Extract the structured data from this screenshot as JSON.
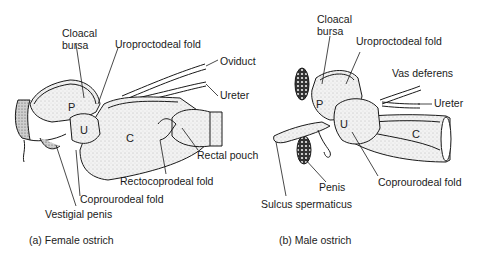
{
  "figure": {
    "panels": [
      {
        "id": "a",
        "caption": "(a) Female ostrich",
        "labels": {
          "cloacal_bursa_1": "Cloacal",
          "cloacal_bursa_2": "bursa",
          "uroproctodeal_fold": "Uroproctodeal fold",
          "oviduct": "Oviduct",
          "ureter": "Ureter",
          "rectal_pouch": "Rectal pouch",
          "rectocoprodeal_fold": "Rectocoprodeal fold",
          "coprourodeal_fold": "Coprourodeal fold",
          "vestigial_penis": "Vestigial penis"
        },
        "chambers": {
          "p": "P",
          "u": "U",
          "c": "C"
        }
      },
      {
        "id": "b",
        "caption": "(b) Male ostrich",
        "labels": {
          "cloacal_bursa_1": "Cloacal",
          "cloacal_bursa_2": "bursa",
          "uroproctodeal_fold": "Uroproctodeal fold",
          "vas_deferens": "Vas deferens",
          "ureter": "Ureter",
          "penis": "Penis",
          "sulcus_spermaticus": "Sulcus spermaticus",
          "coprourodeal_fold": "Coprourodeal fold"
        },
        "chambers": {
          "p": "P",
          "u": "U",
          "c": "C"
        }
      }
    ]
  }
}
